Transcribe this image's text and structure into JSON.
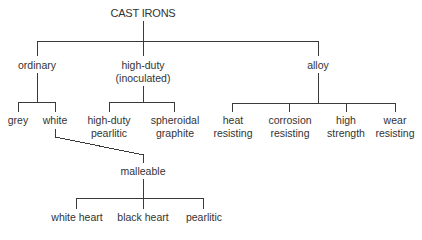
{
  "diagram": {
    "title": "CAST IRONS",
    "type": "tree",
    "root": {
      "label": "CAST IRONS",
      "children": [
        {
          "label": "ordinary",
          "children": [
            {
              "label": "grey"
            },
            {
              "label": "white",
              "children": [
                {
                  "label": "malleable",
                  "children": [
                    {
                      "label": "white heart"
                    },
                    {
                      "label": "black heart"
                    },
                    {
                      "label": "pearlitic"
                    }
                  ]
                }
              ]
            }
          ]
        },
        {
          "label": "high-duty (inoculated)",
          "children": [
            {
              "label": "high-duty pearlitic"
            },
            {
              "label": "spheroidal graphite"
            }
          ]
        },
        {
          "label": "alloy",
          "children": [
            {
              "label": "heat resisting"
            },
            {
              "label": "corrosion resisting"
            },
            {
              "label": "high strength"
            },
            {
              "label": "wear resisting"
            }
          ]
        }
      ]
    }
  },
  "nodes": {
    "root": "CAST IRONS",
    "ordinary": "ordinary",
    "high_duty_l1": "high-duty",
    "high_duty_l2": "(inoculated)",
    "alloy": "alloy",
    "grey": "grey",
    "white": "white",
    "hd_pearlitic_l1": "high-duty",
    "hd_pearlitic_l2": "pearlitic",
    "spheroidal_l1": "spheroidal",
    "spheroidal_l2": "graphite",
    "heat_l1": "heat",
    "heat_l2": "resisting",
    "corrosion_l1": "corrosion",
    "corrosion_l2": "resisting",
    "strength_l1": "high",
    "strength_l2": "strength",
    "wear_l1": "wear",
    "wear_l2": "resisting",
    "malleable": "malleable",
    "white_heart": "white heart",
    "black_heart": "black heart",
    "pearlitic": "pearlitic"
  },
  "colors": {
    "line": "#3a3a3a",
    "text": "#333333",
    "background": "#ffffff"
  }
}
